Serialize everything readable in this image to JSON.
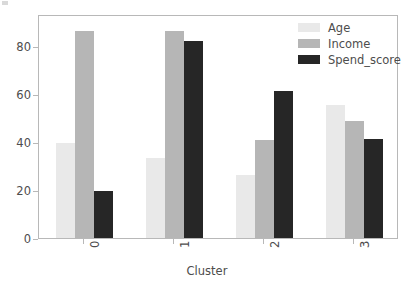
{
  "chart_data": {
    "type": "bar",
    "title": "",
    "xlabel": "Cluster",
    "ylabel": "",
    "categories": [
      "0",
      "1",
      "2",
      "3"
    ],
    "series": [
      {
        "name": "Age",
        "color": "#e9e9e9",
        "values": [
          39.5,
          33.4,
          26.2,
          55.2
        ]
      },
      {
        "name": "Income",
        "color": "#b6b6b6",
        "values": [
          86.1,
          86.2,
          40.9,
          48.9
        ]
      },
      {
        "name": "Spend_score",
        "color": "#262626",
        "values": [
          19.7,
          81.9,
          61.3,
          41.4
        ]
      }
    ],
    "ylim": [
      0,
      93.3
    ],
    "yticks": [
      0,
      20,
      40,
      60,
      80
    ],
    "ytick_labels": [
      "0",
      "20",
      "40",
      "60",
      "80"
    ],
    "xtick_labels": [
      "0",
      "1",
      "2",
      "3"
    ],
    "grid": false,
    "legend_position": "upper right",
    "legend_entries": [
      "Age",
      "Income",
      "Spend_score"
    ]
  },
  "axes": {
    "xlabel": "Cluster"
  }
}
